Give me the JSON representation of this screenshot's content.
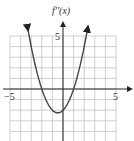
{
  "chart_data": {
    "type": "line",
    "title": "",
    "ylabel": "f''(x)",
    "xlabel": "",
    "xlim": [
      -5,
      5
    ],
    "ylim": [
      -5,
      5.5
    ],
    "grid": true,
    "xticks_labeled": [
      "-5",
      "5"
    ],
    "yticks_labeled": [
      "5"
    ],
    "series": [
      {
        "name": "f''(x)",
        "function": "x^2 + x - 2",
        "x": [
          -3.3,
          -3,
          -2.5,
          -2,
          -1.5,
          -1,
          -0.5,
          0,
          0.5,
          1,
          1.5,
          2,
          2.3
        ],
        "y": [
          5.6,
          4,
          1.75,
          0,
          -1.25,
          -2,
          -2.25,
          -2,
          -1.25,
          0,
          1.75,
          4,
          5.6
        ]
      }
    ]
  },
  "labels": {
    "y_axis": "f''(x)",
    "x_min": "−5",
    "x_max": "5",
    "y_max": "5"
  }
}
